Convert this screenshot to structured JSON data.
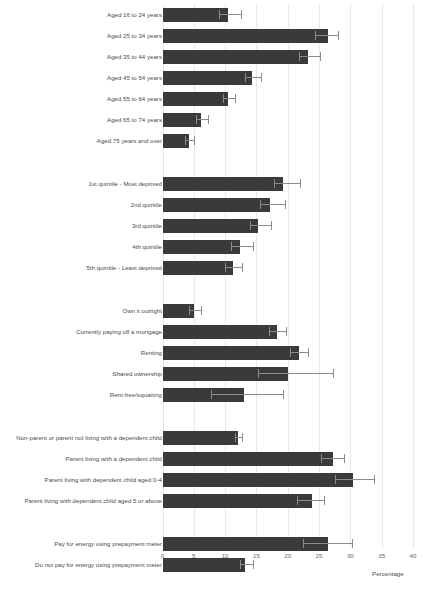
{
  "chart_title_fragment": "",
  "axis": {
    "x_label": "Percentage",
    "x_ticks": [
      0,
      5,
      10,
      15,
      20,
      25,
      30,
      35,
      40
    ],
    "x_min": 0,
    "x_max": 40
  },
  "chart_data": {
    "type": "bar",
    "orientation": "horizontal",
    "title": "",
    "xlabel": "Percentage",
    "ylabel": "",
    "xlim": [
      0,
      40
    ],
    "xticks": [
      0,
      5,
      10,
      15,
      20,
      25,
      30,
      35,
      40
    ],
    "grid": "vertical",
    "legend": "none",
    "error_bars": "95% confidence interval",
    "groups": [
      {
        "name": "Age group",
        "categories": [
          {
            "label": "Aged 16 to 24 years",
            "value": 10.4,
            "ci_low": 9.1,
            "ci_high": 12.5
          },
          {
            "label": "Aged 25 to 34 years",
            "value": 26.5,
            "ci_low": 24.3,
            "ci_high": 28.1
          },
          {
            "label": "Aged 35 to 44 years",
            "value": 23.3,
            "ci_low": 21.8,
            "ci_high": 25.1
          },
          {
            "label": "Aged 45 to 54 years",
            "value": 14.3,
            "ci_low": 13.2,
            "ci_high": 15.7
          },
          {
            "label": "Aged 55 to 64 years",
            "value": 10.5,
            "ci_low": 9.6,
            "ci_high": 11.6
          },
          {
            "label": "Aged 65 to 74 years",
            "value": 6.1,
            "ci_low": 5.3,
            "ci_high": 7.3
          },
          {
            "label": "Aged 75 years and over",
            "value": 4.3,
            "ci_low": 3.6,
            "ci_high": 5.0
          }
        ]
      },
      {
        "name": "Deprivation quintile",
        "categories": [
          {
            "label": "1st quintile - Most deprived",
            "value": 19.3,
            "ci_low": 17.8,
            "ci_high": 22.0
          },
          {
            "label": "2nd quintile",
            "value": 17.2,
            "ci_low": 15.6,
            "ci_high": 19.5
          },
          {
            "label": "3rd quintile",
            "value": 15.3,
            "ci_low": 13.9,
            "ci_high": 17.4
          },
          {
            "label": "4th quintile",
            "value": 12.4,
            "ci_low": 11.0,
            "ci_high": 14.5
          },
          {
            "label": "5th quintile - Least deprived",
            "value": 11.3,
            "ci_low": 10.0,
            "ci_high": 12.7
          }
        ]
      },
      {
        "name": "Housing tenure",
        "categories": [
          {
            "label": "Own it outright",
            "value": 5.0,
            "ci_low": 4.3,
            "ci_high": 6.2
          },
          {
            "label": "Currently paying off a mortgage",
            "value": 18.3,
            "ci_low": 17.0,
            "ci_high": 19.8
          },
          {
            "label": "Renting",
            "value": 21.8,
            "ci_low": 20.4,
            "ci_high": 23.2
          },
          {
            "label": "Shared ownership",
            "value": 20.1,
            "ci_low": 15.3,
            "ci_high": 27.3
          },
          {
            "label": "Rent-free/squatting",
            "value": 13.0,
            "ci_low": 7.7,
            "ci_high": 19.2
          }
        ]
      },
      {
        "name": "Parental status",
        "categories": [
          {
            "label": "Non-parent or parent not living with a dependent child",
            "value": 12.1,
            "ci_low": 11.5,
            "ci_high": 12.7
          },
          {
            "label": "Parent living with a dependent child",
            "value": 27.2,
            "ci_low": 25.3,
            "ci_high": 29.0
          },
          {
            "label": "Parent living with dependent child aged 0-4",
            "value": 30.4,
            "ci_low": 27.5,
            "ci_high": 33.7
          },
          {
            "label": "Parent living with dependent child aged 5 or above",
            "value": 23.9,
            "ci_low": 21.5,
            "ci_high": 25.8
          }
        ]
      },
      {
        "name": "Prepayment meter",
        "categories": [
          {
            "label": "Pay for energy using prepayment meter",
            "value": 26.5,
            "ci_low": 22.4,
            "ci_high": 30.2
          },
          {
            "label": "Do not pay for energy using prepayment meter",
            "value": 13.2,
            "ci_low": 12.3,
            "ci_high": 14.4
          }
        ]
      }
    ]
  },
  "colors": {
    "bar": "#3a3a3a",
    "error_bar": "#8c8c8c",
    "gridline": "#e8e8e8",
    "label_text": "#4a4a4a",
    "tick_text": "#6a6a6a"
  }
}
